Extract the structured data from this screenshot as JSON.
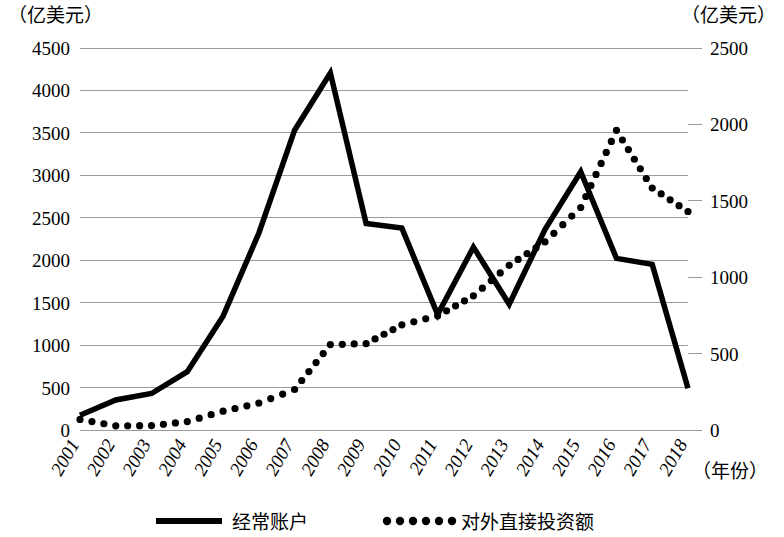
{
  "chart_data": {
    "type": "line",
    "title": "",
    "xlabel": "(年份)",
    "left_axis": {
      "unit_label": "（亿美元）",
      "ticks": [
        0,
        500,
        1000,
        1500,
        2000,
        2500,
        3000,
        3500,
        4000,
        4500
      ],
      "ylim": [
        0,
        4500
      ]
    },
    "right_axis": {
      "unit_label": "（亿美元）",
      "ticks": [
        0,
        500,
        1000,
        1500,
        2000,
        2500
      ],
      "ylim": [
        0,
        2500
      ]
    },
    "categories": [
      "2001",
      "2002",
      "2003",
      "2004",
      "2005",
      "2006",
      "2007",
      "2008",
      "2009",
      "2010",
      "2011",
      "2012",
      "2013",
      "2014",
      "2015",
      "2016",
      "2017",
      "2018"
    ],
    "grid": true,
    "legend_position": "bottom",
    "series": [
      {
        "name": "经常账户",
        "axis": "left",
        "style": "solid",
        "values": [
          174,
          354,
          430,
          687,
          1341,
          2318,
          3532,
          4206,
          2433,
          2378,
          1361,
          2154,
          1482,
          2360,
          3042,
          2022,
          1951,
          491
        ]
      },
      {
        "name": "对外直接投资额",
        "axis": "right",
        "style": "dotted",
        "values": [
          69,
          27,
          29,
          55,
          123,
          176,
          265,
          559,
          565,
          688,
          747,
          878,
          1078,
          1231,
          1456,
          1961,
          1583,
          1430
        ]
      }
    ]
  },
  "legend": {
    "items": [
      {
        "label": "经常账户",
        "marker": "solid-line"
      },
      {
        "label": "对外直接投资额",
        "marker": "dotted-line"
      }
    ]
  },
  "labels": {
    "left_unit": "（亿美元）",
    "right_unit": "（亿美元）",
    "x_axis_name": "（年份）"
  }
}
